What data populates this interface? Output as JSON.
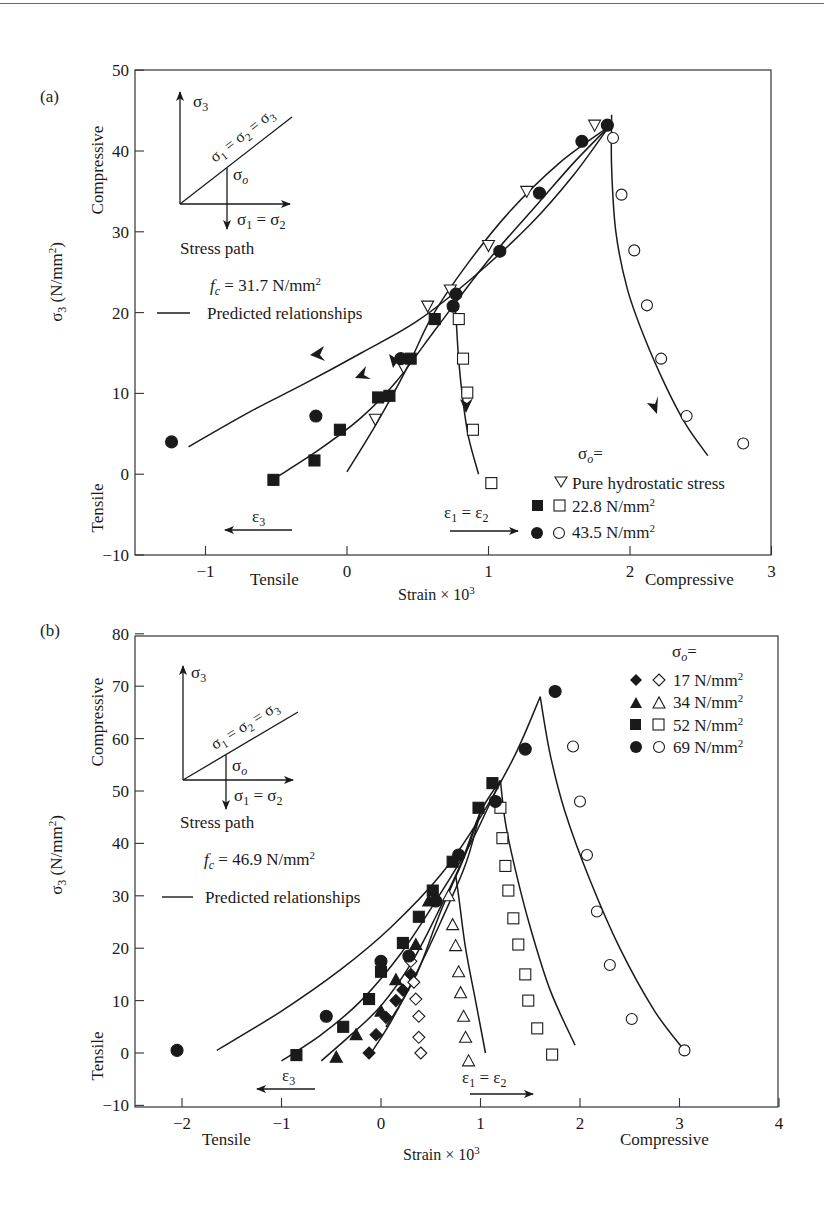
{
  "figure": {
    "panels": [
      {
        "label": "(a)",
        "fc_text": "f",
        "fc_sub": "c",
        "fc_value": " = 31.7 N/mm",
        "predicted_label": "Predicted relationships",
        "inset": {
          "sigma3": "σ",
          "sigma3_sub": "3",
          "diag": "σ₁ = σ₂ = σ₃",
          "sigma_o": "σ",
          "sigma_o_sub": "o",
          "sigma12": "σ₁ = σ₂",
          "caption": "Stress path"
        },
        "eps3_label": "ε₃",
        "eps12_label": "ε₁ = ε₂",
        "x_left_word": "Tensile",
        "x_right_word": "Compressive",
        "y_top_word": "Compressive",
        "y_bottom_word": "Tensile",
        "legend_title": "σ",
        "legend_title_sub": "o",
        "legend_items": [
          "Pure hydrostatic stress",
          "22.8 N/mm",
          "43.5 N/mm"
        ]
      },
      {
        "label": "(b)",
        "fc_text": "f",
        "fc_sub": "c",
        "fc_value": " = 46.9 N/mm",
        "predicted_label": "Predicted relationships",
        "inset": {
          "sigma3": "σ",
          "sigma3_sub": "3",
          "diag": "σ₁ = σ₂ = σ₃",
          "sigma_o": "σ",
          "sigma_o_sub": "o",
          "sigma12": "σ₁ = σ₂",
          "caption": "Stress path"
        },
        "eps3_label": "ε₃",
        "eps12_label": "ε₁ = ε₂",
        "x_left_word": "Tensile",
        "x_right_word": "Compressive",
        "y_top_word": "Compressive",
        "y_bottom_word": "Tensile",
        "legend_title": "σ",
        "legend_title_sub": "o",
        "legend_items": [
          "17 N/mm",
          "34 N/mm",
          "52 N/mm",
          "69 N/mm"
        ]
      }
    ]
  },
  "chart_data": [
    {
      "type": "scatter",
      "title": "(a) f_c = 31.7 N/mm²",
      "xlabel": "Strain × 10³",
      "ylabel": "σ₃ (N/mm²)",
      "xlim": [
        -1.45,
        3
      ],
      "ylim": [
        -10,
        50
      ],
      "xticks": [
        -1,
        0,
        1,
        2,
        3
      ],
      "yticks": [
        -10,
        0,
        10,
        20,
        30,
        40,
        50
      ],
      "grid": false,
      "legend_position": "lower right inside",
      "series": [
        {
          "name": "Pure hydrostatic stress",
          "marker": "triangle-down-open",
          "points": [
            [
              0.2,
              6.8
            ],
            [
              0.4,
              13.2
            ],
            [
              0.57,
              20.8
            ],
            [
              0.73,
              22.8
            ],
            [
              1.0,
              28.3
            ],
            [
              1.27,
              35.0
            ],
            [
              1.75,
              43.2
            ]
          ]
        },
        {
          "name": "22.8 N/mm² (ε₃, filled)",
          "marker": "square-filled",
          "points": [
            [
              -0.52,
              -0.7
            ],
            [
              -0.23,
              1.7
            ],
            [
              -0.05,
              5.5
            ],
            [
              0.22,
              9.5
            ],
            [
              0.3,
              9.7
            ],
            [
              0.45,
              14.3
            ],
            [
              0.62,
              19.2
            ]
          ]
        },
        {
          "name": "22.8 N/mm² (ε₁=ε₂, open)",
          "marker": "square-open",
          "points": [
            [
              0.79,
              19.2
            ],
            [
              0.82,
              14.3
            ],
            [
              0.85,
              10.1
            ],
            [
              0.89,
              5.5
            ],
            [
              1.02,
              -1.1
            ]
          ]
        },
        {
          "name": "43.5 N/mm² (ε₃, filled)",
          "marker": "circle-filled",
          "points": [
            [
              -1.24,
              4.0
            ],
            [
              -0.22,
              7.2
            ],
            [
              0.38,
              14.3
            ],
            [
              0.75,
              20.8
            ],
            [
              0.77,
              22.3
            ],
            [
              1.08,
              27.6
            ],
            [
              1.36,
              34.8
            ],
            [
              1.66,
              41.2
            ],
            [
              1.84,
              43.2
            ]
          ]
        },
        {
          "name": "43.5 N/mm² (ε₁=ε₂, open)",
          "marker": "circle-open",
          "points": [
            [
              1.88,
              41.6
            ],
            [
              1.94,
              34.6
            ],
            [
              2.03,
              27.7
            ],
            [
              2.12,
              20.9
            ],
            [
              2.22,
              14.3
            ],
            [
              2.4,
              7.2
            ],
            [
              2.8,
              3.8
            ]
          ]
        },
        {
          "name": "Predicted relationships",
          "marker": "line",
          "curves": [
            [
              [
                -1.12,
                3.4
              ],
              [
                -0.7,
                7.6
              ],
              [
                -0.3,
                11.2
              ],
              [
                0.1,
                15.0
              ],
              [
                0.5,
                19.0
              ],
              [
                0.9,
                24.5
              ],
              [
                1.3,
                31.0
              ],
              [
                1.6,
                37.0
              ],
              [
                1.85,
                43.0
              ]
            ],
            [
              [
                -0.5,
                -0.4
              ],
              [
                -0.2,
                3.0
              ],
              [
                0.1,
                7.0
              ],
              [
                0.35,
                11.5
              ],
              [
                0.65,
                18.5
              ],
              [
                1.0,
                26.5
              ],
              [
                1.35,
                33.5
              ],
              [
                1.6,
                38.5
              ],
              [
                1.85,
                43.0
              ]
            ],
            [
              [
                0.0,
                0.3
              ],
              [
                0.2,
                6.0
              ],
              [
                0.42,
                13.0
              ],
              [
                0.6,
                19.5
              ],
              [
                0.85,
                26.0
              ],
              [
                1.15,
                32.5
              ],
              [
                1.5,
                38.5
              ],
              [
                1.85,
                43.0
              ]
            ],
            [
              [
                0.76,
                21.5
              ],
              [
                0.77,
                19.5
              ],
              [
                0.79,
                14.0
              ],
              [
                0.82,
                9.0
              ],
              [
                0.86,
                4.5
              ],
              [
                0.93,
                0.0
              ]
            ],
            [
              [
                1.87,
                44.5
              ],
              [
                1.87,
                38.0
              ],
              [
                1.9,
                30.0
              ],
              [
                1.98,
                23.0
              ],
              [
                2.1,
                17.0
              ],
              [
                2.25,
                11.0
              ],
              [
                2.4,
                6.0
              ],
              [
                2.55,
                2.3
              ]
            ]
          ]
        }
      ]
    },
    {
      "type": "scatter",
      "title": "(b) f_c = 46.9 N/mm²",
      "xlabel": "Strain × 10³",
      "ylabel": "σ₃ (N/mm²)",
      "xlim": [
        -2.5,
        4
      ],
      "ylim": [
        -10,
        80
      ],
      "xticks": [
        -2,
        -1,
        0,
        1,
        2,
        3,
        4
      ],
      "yticks": [
        -10,
        0,
        10,
        20,
        30,
        40,
        50,
        60,
        70,
        80
      ],
      "grid": false,
      "legend_position": "upper right inside",
      "series": [
        {
          "name": "17 N/mm² (filled)",
          "marker": "diamond-filled",
          "points": [
            [
              -0.12,
              0.0
            ],
            [
              -0.05,
              3.5
            ],
            [
              0.05,
              6.8
            ],
            [
              0.15,
              10.0
            ],
            [
              0.22,
              12.0
            ],
            [
              0.3,
              15.0
            ]
          ]
        },
        {
          "name": "17 N/mm² (open)",
          "marker": "diamond-open",
          "points": [
            [
              0.4,
              0.0
            ],
            [
              0.38,
              3.0
            ],
            [
              0.38,
              7.0
            ],
            [
              0.35,
              10.3
            ],
            [
              0.33,
              13.5
            ],
            [
              0.3,
              17.5
            ]
          ]
        },
        {
          "name": "34 N/mm² (filled)",
          "marker": "triangle-filled",
          "points": [
            [
              -0.45,
              -0.8
            ],
            [
              -0.25,
              3.5
            ],
            [
              0.0,
              8.0
            ],
            [
              0.15,
              14.0
            ],
            [
              0.35,
              20.7
            ],
            [
              0.48,
              29.0
            ]
          ]
        },
        {
          "name": "34 N/mm² (open)",
          "marker": "triangle-open",
          "points": [
            [
              0.88,
              -1.5
            ],
            [
              0.85,
              3.0
            ],
            [
              0.83,
              7.0
            ],
            [
              0.8,
              11.5
            ],
            [
              0.78,
              15.5
            ],
            [
              0.75,
              20.5
            ],
            [
              0.72,
              24.5
            ],
            [
              0.68,
              30.0
            ]
          ]
        },
        {
          "name": "52 N/mm² (filled)",
          "marker": "square-filled",
          "points": [
            [
              -0.85,
              -0.4
            ],
            [
              -0.38,
              5.0
            ],
            [
              -0.12,
              10.3
            ],
            [
              0.0,
              15.5
            ],
            [
              0.22,
              21.0
            ],
            [
              0.38,
              26.0
            ],
            [
              0.52,
              31.0
            ],
            [
              0.72,
              36.5
            ],
            [
              0.98,
              46.8
            ],
            [
              1.12,
              51.5
            ]
          ]
        },
        {
          "name": "52 N/mm² (open)",
          "marker": "square-open",
          "points": [
            [
              1.72,
              -0.3
            ],
            [
              1.57,
              4.7
            ],
            [
              1.48,
              10.0
            ],
            [
              1.45,
              15.0
            ],
            [
              1.38,
              20.7
            ],
            [
              1.33,
              25.7
            ],
            [
              1.28,
              31.0
            ],
            [
              1.25,
              35.7
            ],
            [
              1.22,
              41.0
            ],
            [
              1.2,
              46.8
            ]
          ]
        },
        {
          "name": "69 N/mm² (filled)",
          "marker": "circle-filled",
          "points": [
            [
              -2.05,
              0.5
            ],
            [
              -0.55,
              7.0
            ],
            [
              0.0,
              17.5
            ],
            [
              0.28,
              18.5
            ],
            [
              0.55,
              29.0
            ],
            [
              0.78,
              37.8
            ],
            [
              1.15,
              48.0
            ],
            [
              1.45,
              58.0
            ],
            [
              1.75,
              69.0
            ]
          ]
        },
        {
          "name": "69 N/mm² (open)",
          "marker": "circle-open",
          "points": [
            [
              1.93,
              58.5
            ],
            [
              2.0,
              48.0
            ],
            [
              2.07,
              37.8
            ],
            [
              2.17,
              27.0
            ],
            [
              2.3,
              16.8
            ],
            [
              2.52,
              6.5
            ],
            [
              3.05,
              0.5
            ]
          ]
        },
        {
          "name": "Predicted relationships",
          "marker": "line",
          "curves": [
            [
              [
                -1.65,
                0.5
              ],
              [
                -1.0,
                8.0
              ],
              [
                -0.4,
                16.0
              ],
              [
                0.1,
                24.0
              ],
              [
                0.6,
                34.0
              ],
              [
                1.0,
                45.0
              ],
              [
                1.35,
                57.0
              ],
              [
                1.6,
                68.0
              ]
            ],
            [
              [
                -1.0,
                -1.5
              ],
              [
                -0.6,
                3.5
              ],
              [
                -0.2,
                10.0
              ],
              [
                0.2,
                19.0
              ],
              [
                0.55,
                29.0
              ],
              [
                0.9,
                40.0
              ],
              [
                1.2,
                52.0
              ]
            ],
            [
              [
                -0.6,
                -1.5
              ],
              [
                -0.3,
                3.5
              ],
              [
                0.0,
                9.0
              ],
              [
                0.3,
                17.0
              ],
              [
                0.55,
                26.0
              ],
              [
                0.8,
                36.0
              ],
              [
                1.0,
                46.0
              ],
              [
                1.2,
                52.0
              ]
            ],
            [
              [
                -0.1,
                0.0
              ],
              [
                0.1,
                6.0
              ],
              [
                0.35,
                15.0
              ],
              [
                0.6,
                25.0
              ],
              [
                0.85,
                36.0
              ],
              [
                1.0,
                46.0
              ]
            ],
            [
              [
                0.05,
                5.0
              ],
              [
                0.2,
                9.5
              ],
              [
                0.38,
                16.0
              ],
              [
                0.6,
                27.0
              ],
              [
                0.85,
                38.0
              ],
              [
                1.0,
                46.0
              ]
            ],
            [
              [
                1.05,
                0.0
              ],
              [
                0.95,
                10.0
              ],
              [
                0.85,
                20.0
              ],
              [
                0.78,
                30.0
              ],
              [
                0.75,
                34.0
              ]
            ],
            [
              [
                1.2,
                52.0
              ],
              [
                1.25,
                44.0
              ],
              [
                1.35,
                35.0
              ],
              [
                1.5,
                24.0
              ],
              [
                1.7,
                12.0
              ],
              [
                1.95,
                1.5
              ]
            ],
            [
              [
                1.6,
                68.0
              ],
              [
                1.7,
                57.0
              ],
              [
                1.85,
                46.0
              ],
              [
                2.1,
                33.0
              ],
              [
                2.4,
                20.0
              ],
              [
                2.75,
                8.0
              ],
              [
                3.05,
                0.5
              ]
            ]
          ]
        }
      ]
    }
  ]
}
